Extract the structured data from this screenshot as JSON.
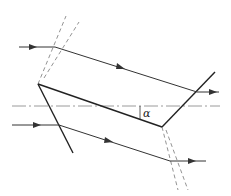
{
  "diagram": {
    "type": "optical-prism-ray-diagram",
    "colors": {
      "line": "#333333",
      "axis": "#9a9a9a",
      "dashed": "#777777",
      "background": "#ffffff"
    },
    "labels": {
      "angle": "α"
    },
    "elements": [
      {
        "name": "optical-axis",
        "style": "dash-dot"
      },
      {
        "name": "upper-input-ray",
        "arrow": true
      },
      {
        "name": "upper-refracted-ray",
        "arrow": true
      },
      {
        "name": "upper-output-ray",
        "arrow": true
      },
      {
        "name": "lower-input-ray",
        "arrow": true
      },
      {
        "name": "lower-refracted-ray",
        "arrow": true
      },
      {
        "name": "lower-output-ray",
        "arrow": true
      },
      {
        "name": "left-face"
      },
      {
        "name": "right-face"
      },
      {
        "name": "bottom-face"
      },
      {
        "name": "top-left-normal-lines",
        "style": "dashed"
      },
      {
        "name": "bottom-right-normal-lines",
        "style": "dashed"
      }
    ]
  }
}
